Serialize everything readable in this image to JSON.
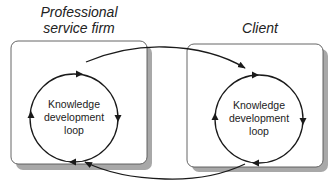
{
  "diagram": {
    "organizations": [
      {
        "title_line1": "Professional",
        "title_line2": "service firm",
        "loop_label_line1": "Knowledge",
        "loop_label_line2": "development",
        "loop_label_line3": "loop"
      },
      {
        "title_line1": "Client",
        "loop_label_line1": "Knowledge",
        "loop_label_line2": "development",
        "loop_label_line3": "loop"
      }
    ],
    "connectors": [
      {
        "from": "Professional service firm",
        "to": "Client",
        "direction": "top arrow, left to right"
      },
      {
        "from": "Client",
        "to": "Professional service firm",
        "direction": "bottom arrow, right to left"
      }
    ],
    "colors": {
      "line": "#1a1a1a",
      "box_border": "#555555",
      "shadow": "#a8a8a8",
      "background": "#ffffff"
    }
  }
}
